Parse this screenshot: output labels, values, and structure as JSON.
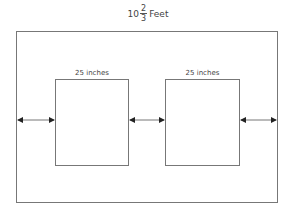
{
  "title": {
    "whole": "10",
    "numerator": "2",
    "denominator": "3",
    "unit": "Feet"
  },
  "boxes": [
    {
      "label": "25 inches"
    },
    {
      "label": "25 inches"
    }
  ],
  "colors": {
    "line": "#777777",
    "arrow": "#222222",
    "text": "#444444"
  }
}
